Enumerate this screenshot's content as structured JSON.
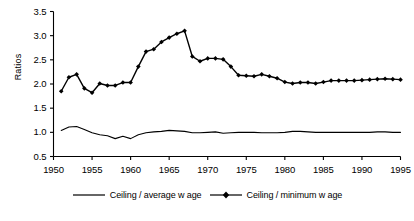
{
  "chart_data": {
    "type": "line",
    "title": "",
    "xlabel": "",
    "ylabel": "Ratios",
    "xlim": [
      1950,
      1995
    ],
    "ylim": [
      0.5,
      3.5
    ],
    "ytick_labels": [
      "0.5",
      "1.0",
      "1.5",
      "2.0",
      "2.5",
      "3.0",
      "3.5"
    ],
    "ytick_values": [
      0.5,
      1.0,
      1.5,
      2.0,
      2.5,
      3.0,
      3.5
    ],
    "xtick_labels": [
      "1950",
      "1955",
      "1960",
      "1965",
      "1970",
      "1975",
      "1980",
      "1985",
      "1990",
      "1995"
    ],
    "xtick_values": [
      1950,
      1955,
      1960,
      1965,
      1970,
      1975,
      1980,
      1985,
      1990,
      1995
    ],
    "grid": false,
    "legend_position": "bottom",
    "x": [
      1951,
      1952,
      1953,
      1954,
      1955,
      1956,
      1957,
      1958,
      1959,
      1960,
      1961,
      1962,
      1963,
      1964,
      1965,
      1966,
      1967,
      1968,
      1969,
      1970,
      1971,
      1972,
      1973,
      1974,
      1975,
      1976,
      1977,
      1978,
      1979,
      1980,
      1981,
      1982,
      1983,
      1984,
      1985,
      1986,
      1987,
      1988,
      1989,
      1990,
      1991,
      1992,
      1993,
      1994,
      1995
    ],
    "series": [
      {
        "name": "Ceiling / average w age",
        "marker": "none",
        "color": "#000000",
        "values": [
          1.04,
          1.11,
          1.12,
          1.06,
          0.99,
          0.95,
          0.93,
          0.87,
          0.92,
          0.87,
          0.95,
          0.99,
          1.01,
          1.02,
          1.04,
          1.03,
          1.02,
          0.99,
          0.99,
          1.0,
          1.01,
          0.98,
          0.99,
          1.0,
          1.0,
          1.0,
          0.99,
          0.99,
          0.99,
          1.0,
          1.02,
          1.02,
          1.01,
          1.0,
          1.0,
          1.0,
          1.0,
          1.0,
          1.0,
          1.0,
          1.0,
          1.01,
          1.01,
          1.0,
          1.0
        ]
      },
      {
        "name": "Ceiling / minimum w age",
        "marker": "diamond",
        "color": "#000000",
        "values": [
          1.85,
          2.14,
          2.2,
          1.91,
          1.82,
          2.01,
          1.97,
          1.97,
          2.03,
          2.03,
          2.36,
          2.67,
          2.72,
          2.87,
          2.96,
          3.04,
          3.1,
          2.57,
          2.47,
          2.53,
          2.53,
          2.51,
          2.36,
          2.18,
          2.17,
          2.16,
          2.2,
          2.16,
          2.12,
          2.04,
          2.01,
          2.03,
          2.03,
          2.01,
          2.04,
          2.07,
          2.07,
          2.07,
          2.07,
          2.08,
          2.09,
          2.1,
          2.11,
          2.1,
          2.09
        ]
      }
    ]
  },
  "legend": {
    "items": [
      {
        "label": "Ceiling / average w age",
        "marker": "none"
      },
      {
        "label": "Ceiling / minimum w age",
        "marker": "diamond"
      }
    ]
  }
}
